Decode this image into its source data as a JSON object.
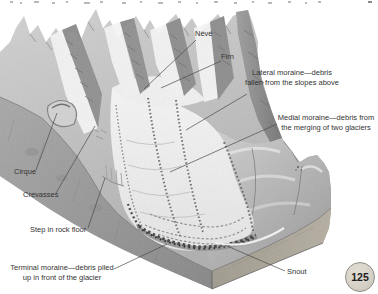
{
  "figure": {
    "labels": {
      "neve": "Névé",
      "firn": "Firn",
      "lateral_line1": "Lateral moraine—debris",
      "lateral_line2": "fallen from the slopes above",
      "medial_line1": "Medial moraine—debris from",
      "medial_line2": "the merging of two glaciers",
      "cirque": "Cirque",
      "crevasses": "Crevasses",
      "step": "Step in rock floor",
      "terminal_line1": "Terminal moraine—debris piled",
      "terminal_line2": "up in front of the glacier",
      "snout": "Snout"
    }
  },
  "page_badge": {
    "number": "125"
  },
  "colors": {
    "label_text": "#343434",
    "leader_line": "#4a4a4a",
    "badge_fill": "#d6d2c8",
    "badge_border": "#8f8d85",
    "rock_face_left": "#979797",
    "rock_face_right": "#aba396",
    "ice": "#efefef"
  }
}
